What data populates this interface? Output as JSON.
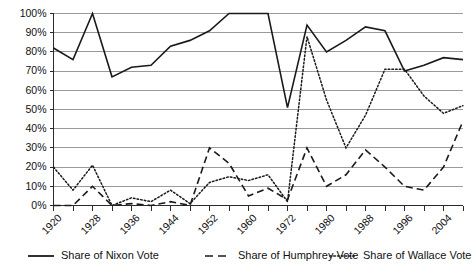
{
  "chart_data": {
    "type": "line",
    "title": "",
    "subtitle": "",
    "xlabel": "",
    "ylabel": "",
    "ylim": [
      0,
      100
    ],
    "ytick_labels": [
      "0%",
      "10%",
      "20%",
      "30%",
      "40%",
      "50%",
      "60%",
      "70%",
      "80%",
      "90%",
      "100%"
    ],
    "ytick_values": [
      0,
      10,
      20,
      30,
      40,
      50,
      60,
      70,
      80,
      90,
      100
    ],
    "grid": true,
    "legend_position": "bottom",
    "x": [
      1920,
      1924,
      1928,
      1932,
      1936,
      1940,
      1944,
      1948,
      1952,
      1956,
      1960,
      1964,
      1968,
      1972,
      1976,
      1980,
      1984,
      1988,
      1992,
      1996,
      2000,
      2004
    ],
    "xtick_labels": [
      "1920",
      "",
      "1928",
      "",
      "1936",
      "",
      "1944",
      "",
      "1952",
      "",
      "1960",
      "",
      "1972",
      "",
      "1980",
      "",
      "1988",
      "",
      "1996",
      "",
      "2004",
      ""
    ],
    "xtick_labels_visible": [
      "1920",
      "1928",
      "1936",
      "1944",
      "1952",
      "1960",
      "1972",
      "1980",
      "1988",
      "1996",
      "2004"
    ],
    "series": [
      {
        "name": "Share of Nixon Vote",
        "style": "solid",
        "color": "#1a1a1a",
        "values": [
          82,
          76,
          100,
          67,
          72,
          73,
          83,
          86,
          91,
          100,
          100,
          100,
          51,
          94,
          80,
          86,
          93,
          91,
          70,
          73,
          77,
          76
        ]
      },
      {
        "name": "Share of Humphrey Vote",
        "style": "dashed",
        "color": "#1a1a1a",
        "values": [
          0,
          0,
          10,
          0,
          1,
          0,
          2,
          0,
          30,
          22,
          5,
          9,
          3,
          30,
          10,
          16,
          29,
          20,
          10,
          8,
          20,
          44
        ]
      },
      {
        "name": "Share of Wallace Vote",
        "style": "dotted",
        "color": "#1a1a1a",
        "values": [
          20,
          8,
          21,
          0,
          4,
          2,
          8,
          1,
          12,
          15,
          13,
          16,
          2,
          88,
          55,
          30,
          47,
          71,
          71,
          57,
          48,
          52
        ]
      }
    ],
    "series_end_values": {
      "nixon_final": 76,
      "humphrey_final": 52,
      "wallace_final": 80
    }
  },
  "legend": {
    "items": [
      {
        "label": "Share of Nixon Vote",
        "style": "solid"
      },
      {
        "label": "Share of Humphrey Vote",
        "style": "dashed"
      },
      {
        "label": "Share of Wallace Vote",
        "style": "dotted"
      }
    ]
  }
}
